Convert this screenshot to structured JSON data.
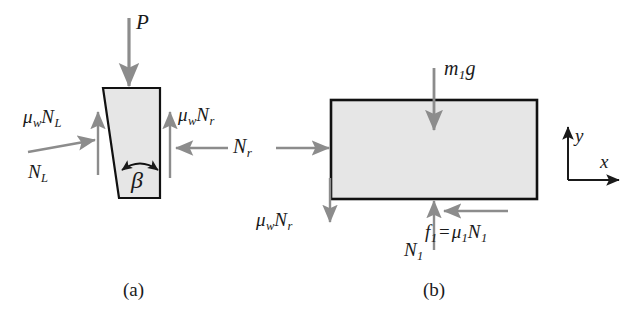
{
  "figure": {
    "background_color": "#ffffff",
    "width": 644,
    "height": 322,
    "body_fill": "#e6e6e6",
    "body_stroke": "#111111",
    "arrow_color": "#8c8c8c",
    "axis_color": "#1a1a1a",
    "text_color": "#1a1a1a"
  },
  "panel_a": {
    "caption": "(a)",
    "shape_name": "wedge",
    "angle_label": "β",
    "labels": {
      "applied_load": "P",
      "left_normal": "N",
      "left_normal_sub": "L",
      "left_friction_mu": "μ",
      "left_friction_mu_sub": "w",
      "left_friction_N": "N",
      "left_friction_N_sub": "L",
      "right_friction_mu": "μ",
      "right_friction_mu_sub": "w",
      "right_friction_N": "N",
      "right_friction_N_sub": "r"
    }
  },
  "panel_shared": {
    "interaction_label_N": "N",
    "interaction_label_sub": "r"
  },
  "panel_b": {
    "caption": "(b)",
    "shape_name": "block",
    "labels": {
      "weight_m": "m",
      "weight_m_sub": "1",
      "weight_g": "g",
      "wall_friction_mu": "μ",
      "wall_friction_mu_sub": "w",
      "wall_friction_N": "N",
      "wall_friction_N_sub": "r",
      "ground_normal": "N",
      "ground_normal_sub": "1",
      "friction_f": "f",
      "friction_f_sub": "1",
      "friction_eq": "=",
      "friction_mu": "μ",
      "friction_mu_sub": "1",
      "friction_N": "N",
      "friction_N_sub": "1"
    }
  },
  "axes": {
    "x_label": "x",
    "y_label": "y"
  }
}
